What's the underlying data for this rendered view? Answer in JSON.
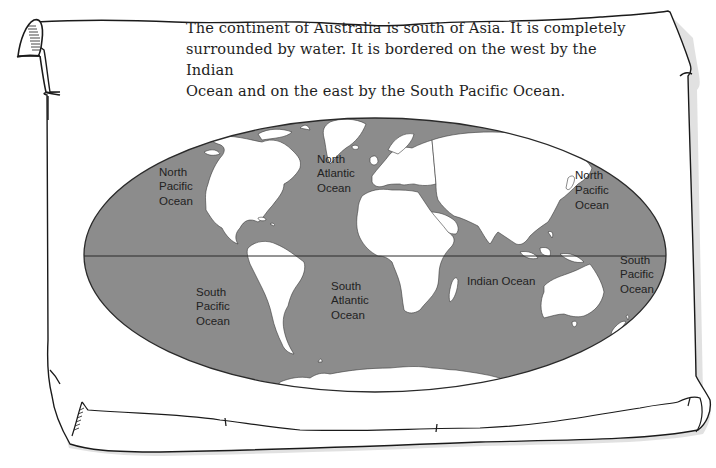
{
  "caption": {
    "line1": "The continent of Australia is south of Asia. It is completely",
    "line2": "surrounded by water. It is bordered on the west by the Indian",
    "line3": "Ocean and on the east by the South Pacific Ocean."
  },
  "map": {
    "projection": "elliptical world map",
    "colors": {
      "ocean": "#8c8c8c",
      "land": "#ffffff",
      "outline": "#2a2a2a",
      "paper": "#ffffff"
    },
    "labels": {
      "north_pacific_west": [
        "North",
        "Pacific",
        "Ocean"
      ],
      "north_atlantic": [
        "North",
        "Atlantic",
        "Ocean"
      ],
      "north_pacific_east": [
        "North",
        "Pacific",
        "Ocean"
      ],
      "south_pacific_west": [
        "South",
        "Pacific",
        "Ocean"
      ],
      "south_atlantic": [
        "South",
        "Atlantic",
        "Ocean"
      ],
      "indian": "Indian Ocean",
      "south_pacific_east": [
        "South",
        "Pacific",
        "Ocean"
      ]
    }
  }
}
